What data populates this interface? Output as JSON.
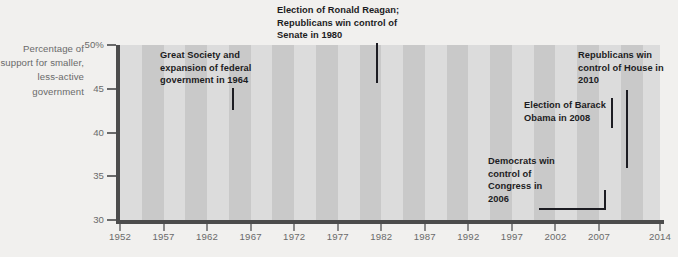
{
  "axis_caption": "Percentage of support for smaller, less-active government",
  "y_axis": {
    "label_top": "50%",
    "ticks": [
      "50%",
      "45",
      "40",
      "35",
      "30"
    ],
    "min": 30,
    "max": 50
  },
  "x_axis": {
    "ticks": [
      "1952",
      "1957",
      "1962",
      "1967",
      "1972",
      "1977",
      "1982",
      "1987",
      "1992",
      "1997",
      "2002",
      "2007",
      "2014"
    ]
  },
  "annotations": [
    {
      "id": "great-society",
      "text": "Great Society and expansion of federal government in 1964"
    },
    {
      "id": "reagan",
      "text": "Election of Ronald Reagan; Republicans win control of Senate in 1980"
    },
    {
      "id": "democrats-2006",
      "text": "Democrats win control of Congress in 2006"
    },
    {
      "id": "obama-2008",
      "text": "Election of Barack Obama in 2008"
    },
    {
      "id": "republicans-2010",
      "text": "Republicans win control of House in 2010"
    }
  ],
  "colors": {
    "page_background": "#f1f0ee",
    "stripe_light": "#dcdcdc",
    "stripe_dark": "#c9c9c9",
    "line": "#5a5a5f",
    "axis": "#4c4c4c",
    "tick_text": "#6a6a6a",
    "annotation_text": "#1c1c22"
  },
  "chart_data": {
    "type": "line",
    "title": "",
    "xlabel": "",
    "ylabel": "Percentage of support for smaller, less-active government",
    "xlim": [
      1952,
      2014
    ],
    "ylim": [
      30,
      50
    ],
    "grid": false,
    "legend": "none",
    "background": "alternating vertical gray stripes every ~2.5 years",
    "x": [
      1952,
      1953,
      1954,
      1955,
      1956,
      1957,
      1958,
      1959,
      1960,
      1961,
      1962,
      1963,
      1964,
      1965,
      1966,
      1967,
      1968,
      1969,
      1970,
      1971,
      1972,
      1973,
      1974,
      1975,
      1976,
      1977,
      1978,
      1979,
      1980,
      1981,
      1982,
      1983,
      1984,
      1985,
      1986,
      1987,
      1988,
      1989,
      1990,
      1991,
      1992,
      1993,
      1994,
      1995,
      1996,
      1997,
      1998,
      1999,
      2000,
      2001,
      2002,
      2003,
      2004,
      2005,
      2006,
      2007,
      2008,
      2009,
      2010,
      2011,
      2012,
      2013,
      2014
    ],
    "y": [
      49.7,
      46.0,
      42.6,
      39.5,
      36.3,
      38.0,
      41.5,
      40.2,
      38.8,
      38.0,
      38.0,
      36.5,
      33.3,
      31.4,
      31.4,
      34.0,
      36.8,
      39.6,
      42.4,
      40.5,
      39.6,
      40.9,
      44.2,
      47.8,
      42.9,
      40.1,
      39.9,
      36.4,
      37.2,
      39.2,
      41.7,
      42.3,
      42.3,
      43.5,
      45.0,
      47.8,
      44.7,
      44.3,
      44.4,
      40.4,
      38.7,
      38.3,
      38.7,
      38.6,
      39.4,
      40.5,
      41.0,
      41.0,
      40.0,
      39.4,
      38.3,
      37.0,
      36.2,
      36.2,
      35.6,
      35.2,
      34.8,
      35.2,
      36.0,
      36.4,
      37.2,
      38.0,
      38.6
    ],
    "series": [
      {
        "name": "Support for smaller, less-active government",
        "description": "Peaks near 50% in 1952 and ~48% in 1980; troughs near 31% in 1965-66 and ~33.5% in 2007-08; rises to ~41% by 2014."
      }
    ],
    "annotated_years": [
      1964,
      1980,
      2006,
      2008,
      2010
    ]
  }
}
